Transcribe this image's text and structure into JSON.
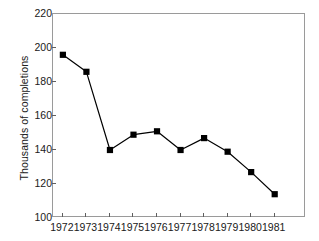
{
  "chart_data": {
    "type": "line",
    "title": "",
    "subtitle": "",
    "xlabel": "",
    "ylabel": "Thousands of completions",
    "categories": [
      "1972",
      "1973",
      "1974",
      "1975",
      "1976",
      "1977",
      "1978",
      "1979",
      "1980",
      "1981"
    ],
    "values": [
      196,
      186,
      140,
      149,
      151,
      140,
      147,
      139,
      127,
      114
    ],
    "series": [
      {
        "name": "Completions",
        "values": [
          196,
          186,
          140,
          149,
          151,
          140,
          147,
          139,
          127,
          114
        ]
      }
    ],
    "ylim": [
      100,
      220
    ],
    "yticks": [
      100,
      120,
      140,
      160,
      180,
      200,
      220
    ],
    "ytick_labels": [
      "100",
      "120",
      "140",
      "160",
      "180",
      "200",
      "220"
    ],
    "xtick_labels": [
      "1972",
      "1973",
      "1974",
      "1975",
      "1976",
      "1977",
      "1978",
      "1979",
      "1980",
      "1981"
    ],
    "grid": false,
    "legend": "none",
    "marker": "filled-square",
    "line_color": "#000000",
    "marker_color": "#000000",
    "frame_color": "#9a9a9a",
    "background_color": "#ffffff"
  }
}
